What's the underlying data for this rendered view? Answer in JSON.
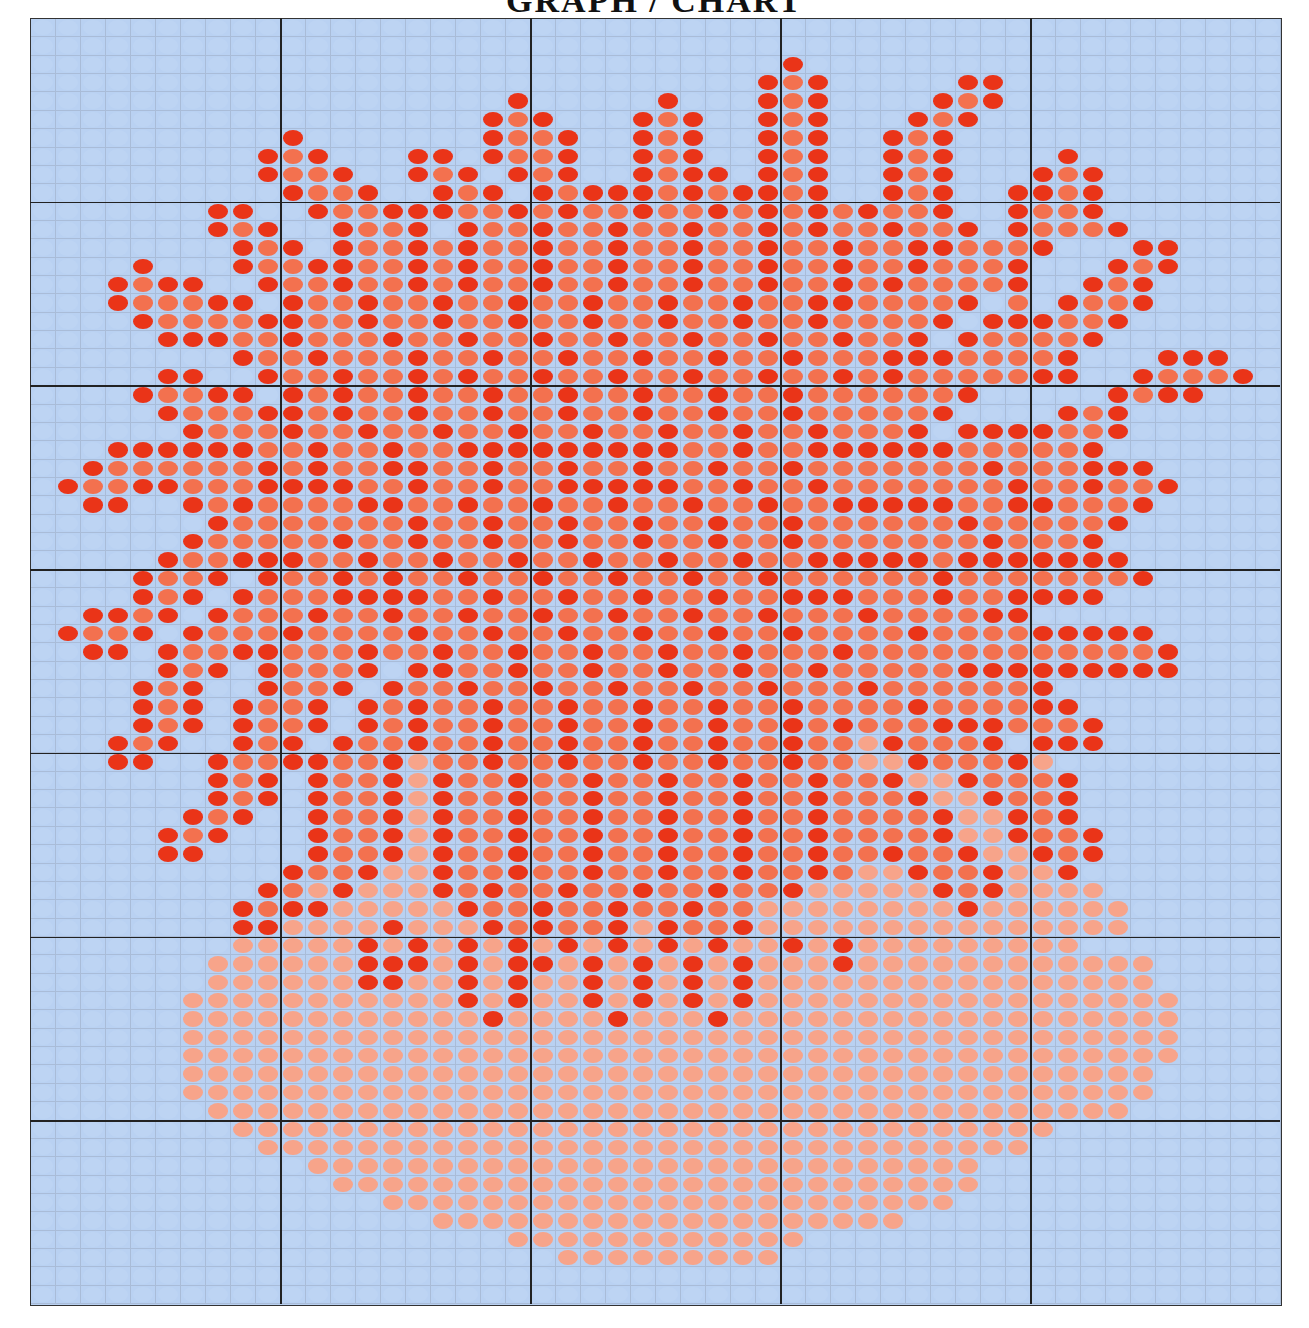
{
  "title": "GRAPH / CHART",
  "palette": {
    "background": "#b9d1f2",
    "dark": "#ea3418",
    "mid": "#f3714f",
    "salmon": "#f7a48a"
  },
  "legend": {
    ".": "background",
    "d": "dark red",
    "m": "orange red",
    "s": "salmon"
  },
  "chart_data": {
    "type": "heatmap",
    "title": "GRAPH / CHART",
    "columns": 50,
    "rows": 70,
    "major_grid_every": 10,
    "grid": [
      "..................................................",
      "..................................................",
      "..............................d...................",
      ".............................dmd.....dd...........",
      "...................d.....d...dmd....dmd...........",
      "..................dmd...dmd..dmd...dmd............",
      "..........d.......dmmd..dmd..dmd..dmd.............",
      ".........dmd...dd.dmmd..dmd..dmd..dmd....d........",
      ".........dmmd..dmd.dmd..dmdd.dmd..dmd...dmd.......",
      "..........dmmd..dmd.dmdddmdmddmd..dmd..ddmd.......",
      ".......dd..dmmdddmmdmdmmdmmdmdmdmdmmd..dmmd.......",
      ".......dmd..dmmd.dmmdmmdmmdmmdmdmmdmmd.dmmmd......",
      "........dmd.dmmdmdmmdmmdmmdmmdmmdmmddmmmd...dd....",
      "....d...dmmddmmdmdmmdmmdmmdmmdmmdmmdmmmd...dmd....",
      "...dmdd..dmmdmmdmdmmdmmdmmdmmdmmdmdmmmmd..dmd.....",
      "...dmmmdd.dmmdmmdmmdmmdmmdmmdmmddmmmmd.m.dmmd.....",
      "....dmmmmddmmdmmdmmdmmdmmdmmdmmdmmmmd.dddmmd......",
      ".....dddmmdmmmdmmdmmdmmdmmdmmdmmdmmd.dmmmmd.......",
      "........dmmdmmmdmmdmmdmmdmmdmmdmmmdddmmmmd...ddd..",
      ".....dd..dmmdmmdmdmmdmmdmmdmmdmmdmdmmmmmdd..dmmmd.",
      "....dmmdd.dmdmmdmmdmmdmmdmmdmmdmmmmmmd.....dmdd...",
      ".....dmmmddmdmmdmmdmmdmmdmmdmmdmmmmmd....dmd......",
      "......dmmmdmmdmmdmmdmmdmmdmmdmmdmmmd.ddddmmd......",
      "...ddddddmmdmmdmmdddddddddmmdmmddddddmmmmmd.......",
      "..dmmmmmmdmdmmddmmdmmdmmdmmdmmdmmmmmmmdmmmddd.....",
      ".dmmddmmmddddmmdmmdmmdddddmmdmmdmmmmmmmdmmdmmd....",
      "..dd..dmdmmmmddmmdmmdmmdmmdmmdmmdddddmmddmmmd.....",
      ".......dmmmmmmmdmmdmmdmmdmmdmmdmmmmmmdmmmmmd......",
      "......dmmmmmdmmdmmdmmdmmdmmdmmdmmmmmmmdmmmd.......",
      ".....dmmdddmmdmmdmmdmmdmmdmmdmmdddddmddddddd......",
      "....dmmd.dmmdmdmmdmmdmmdmmdmmdmmmmmmdmmmmmmmd.....",
      "....dmd.dmmmddddmmdmmdmmdmmdmmdddmmmdmmdddd.......",
      "..ddmd.dmmmdmmdmmdmmdmmdmmdmmdmmmdmmmmdd..........",
      ".dmmd.dmmmdmmmmdmmdmmdmmdmmdmmdmmmmdmmmmddddd.....",
      "..dd.dmmddmmmdmmdmmdmmdmmdmmdmmmdmmmmmmmmmmmmd....",
      ".....dmd.dmmmd.ddmmdmmdmmdmmdmmdmmmmmddddddddd....",
      "....dmd..dmmd.dmmdmmdmmdmmdmmdmmmdmmmmmmd.........",
      "....dmd.dmmd.dmdmmdmmdmmdmmdmmdmmmmdmmmmdd........",
      "....dmd.dmmd.dmdmmdmmdmmdmmdmmdmdmmmdddmmmd.......",
      "...dmd..dmd.dmmdmmdmmdmmdmmdmmdmmsdmmmd.ddd.......",
      "...dd..dmmddmmdsmmdmmdmmdmmdmmdmmssdmmmds.........",
      ".......dmd.dmmdsdmmdmmdmmdmmdmmdmmdssdmmmd........",
      ".......dmd.dmmdsdmmdmmdmmdmmdmmdmmmdssdmmd........",
      "......dmd..dmmdsdmmdmmdmmdmmdmmdmmmmdssdmd........",
      ".....dmd...dmmdsdmmdmmdmmdmmdmmdmmmmdssdmmd.......",
      ".....dd....dmmdsdmmdmmdmmdmmdmmdmmdmmdssdmd.......",
      "..........dmmdssdmmdmmdmmdmmdmmdmssdmmdssd........",
      ".........dmsdsssdmdmmdmmdmmdmmdsssssdmdssss.......",
      "........dmddsssssdmmdmmdmmdmmssssssssdssssss......",
      "........ddssssdsssdmdmmdsdmmdsssssssssssssss......",
      "........sssssdsdsdsdsdsdsdsdssdsdsssssssss........",
      ".......ssssssdddsdsddsdsdsdsdsssdssssssssssss......",
      ".......ssssssddssdsdssdsdsdsdssssssssssssssss.....",
      "......sssssssssssdsdssdsdsdsdsssssssssssssssss....",
      "......ssssssssssssdssssdsssdssssssssssssssssss....",
      "......ssssssssssssssssssssssssssssssssssssssss....",
      "......ssssssssssssssssssssssssssssssssssssssss....",
      "......sssssssssssssssssssssssssssssssssssssss.....",
      "......sssssssssssssssssssssssssssssssssssssss.....",
      ".......sssssssssssssssssssssssssssssssssssss......",
      "........sssssssssssssssssssssssssssssssss.........",
      ".........sssssssssssssssssssssssssssssss..........",
      "...........sssssssssssssssssssssssssss............",
      "............ssssssssssssssssssssssssss............",
      "..............sssssssssssssssssssssss.............",
      "................sssssssssssssssssss...............",
      "...................ssssssssssss...................",
      ".....................sssssssss....................",
      "..................................................",
      ".................................................."
    ]
  }
}
